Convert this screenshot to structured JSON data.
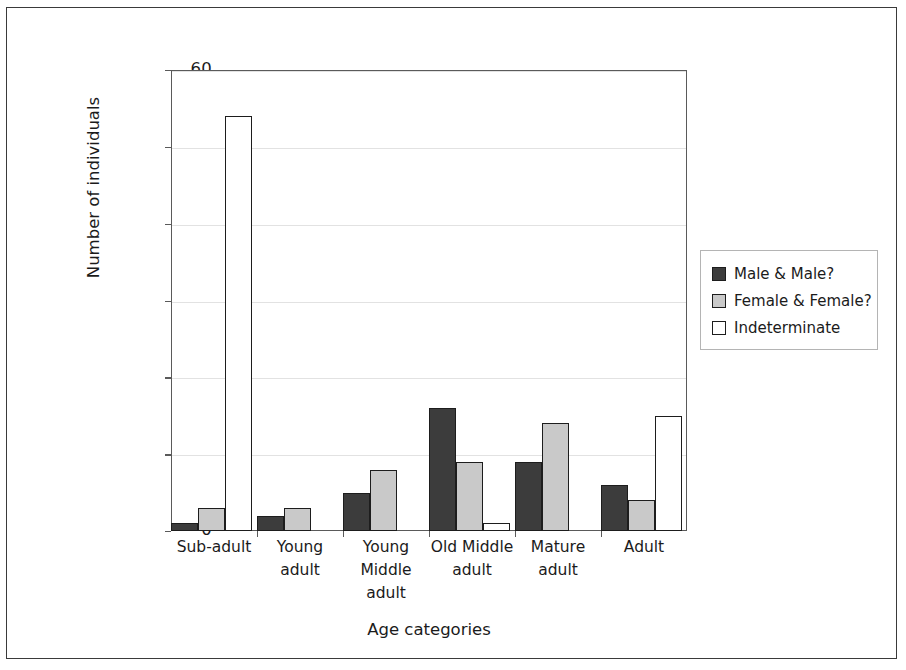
{
  "chart_data": {
    "type": "bar",
    "title": "",
    "xlabel": "Age categories",
    "ylabel": "Number of individuals",
    "ylim": [
      0,
      60
    ],
    "yticks": [
      0,
      10,
      20,
      30,
      40,
      50,
      60
    ],
    "grid": true,
    "legend_position": "right",
    "categories": [
      "Sub-adult",
      "Young adult",
      "Young Middle adult",
      "Old Middle adult",
      "Mature adult",
      "Adult"
    ],
    "category_lines": [
      [
        "Sub-adult"
      ],
      [
        "Young",
        "adult"
      ],
      [
        "Young",
        "Middle",
        "adult"
      ],
      [
        "Old Middle",
        "adult"
      ],
      [
        "Mature",
        "adult"
      ],
      [
        "Adult"
      ]
    ],
    "series": [
      {
        "name": "Male & Male?",
        "color": "#3c3c3c",
        "values": [
          1,
          2,
          5,
          16,
          9,
          6
        ]
      },
      {
        "name": "Female & Female?",
        "color": "#c9c9c9",
        "values": [
          3,
          3,
          8,
          9,
          14,
          4
        ]
      },
      {
        "name": "Indeterminate",
        "color": "#ffffff",
        "values": [
          54,
          0,
          0,
          1,
          0,
          15
        ]
      }
    ]
  },
  "legend": {
    "items": [
      {
        "label": "Male & Male?",
        "swatch": "#3c3c3c"
      },
      {
        "label": "Female & Female?",
        "swatch": "#c9c9c9"
      },
      {
        "label": "Indeterminate",
        "swatch": "#ffffff"
      }
    ]
  },
  "axis": {
    "y_title": "Number of individuals",
    "x_title": "Age categories",
    "y_tick_labels": [
      "0",
      "10",
      "20",
      "30",
      "40",
      "50",
      "60"
    ]
  },
  "colors": {
    "bar_outline": "#1d1d1d",
    "axis": "#5a5a5a",
    "grid": "#e2e2e2",
    "page_border": "#3a3a3a",
    "text": "#1b1b1b"
  }
}
